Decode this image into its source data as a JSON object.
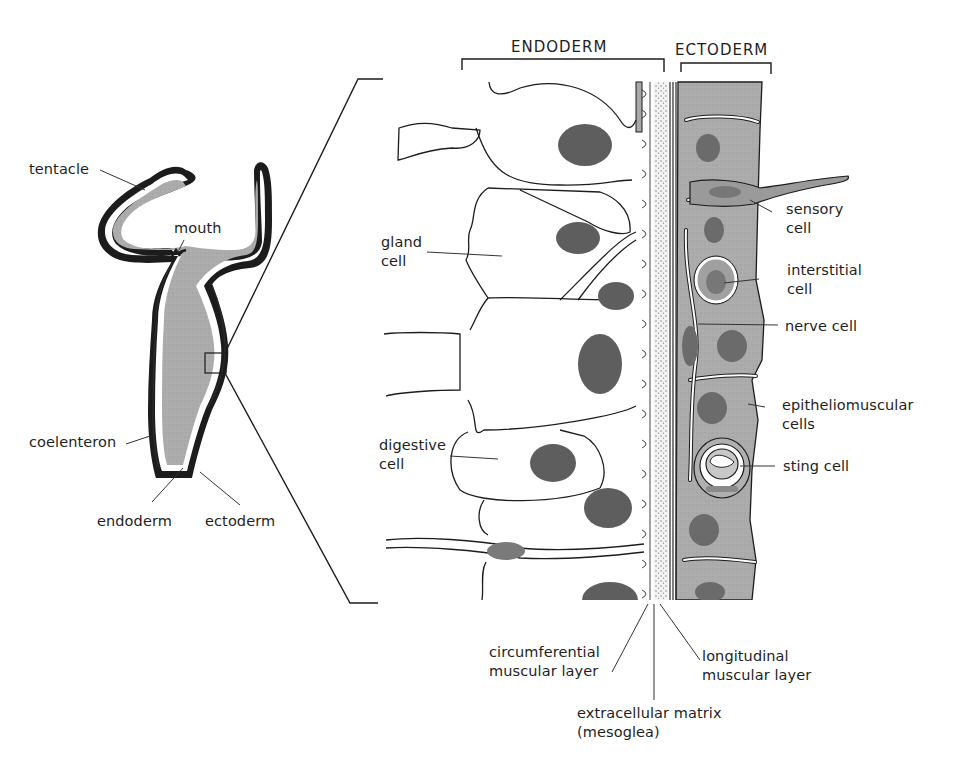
{
  "figure": {
    "colors": {
      "line": "#1c1c1c",
      "tissue_gray": "#a9a9a9",
      "cavity_gray": "#b4b4b4",
      "nucleus": "#5e5e5e",
      "background": "#ffffff"
    }
  },
  "overview": {
    "labels": {
      "tentacle": "tentacle",
      "mouth": "mouth",
      "coelenteron": "coelenteron",
      "endoderm": "endoderm",
      "ectoderm": "ectoderm"
    }
  },
  "detail": {
    "headers": {
      "endoderm": "ENDODERM",
      "ectoderm": "ECTODERM"
    },
    "left_labels": {
      "gland_cell": "gland\ncell",
      "digestive_cell": "digestive\ncell"
    },
    "right_labels": {
      "sensory_cell": "sensory\ncell",
      "interstitial_cell": "interstitial\ncell",
      "nerve_cell": "nerve cell",
      "epitheliomuscular_cells": "epitheliomuscular\ncells",
      "sting_cell": "sting cell"
    },
    "bottom_labels": {
      "circumferential": "circumferential\nmuscular layer",
      "longitudinal": "longitudinal\nmuscular layer",
      "mesoglea": "extracellular matrix\n(mesoglea)"
    }
  }
}
